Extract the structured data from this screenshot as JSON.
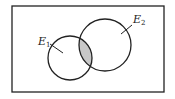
{
  "diagram": {
    "type": "venn",
    "universe": {
      "x": 12,
      "y": 6,
      "width": 152,
      "height": 86
    },
    "sets": [
      {
        "name": "E1",
        "label_main": "E",
        "label_sub": "1",
        "cx": 70,
        "cy": 58,
        "r": 22,
        "label_x": 33,
        "label_y": 46
      },
      {
        "name": "E2",
        "label_main": "E",
        "label_sub": "2",
        "cx": 105,
        "cy": 45,
        "r": 26,
        "label_x": 133,
        "label_y": 26
      }
    ],
    "shaded_region": "E1 ∩ E2",
    "colors": {
      "stroke": "#222222",
      "shade": "#c8c8c8",
      "background": "#ffffff"
    }
  }
}
